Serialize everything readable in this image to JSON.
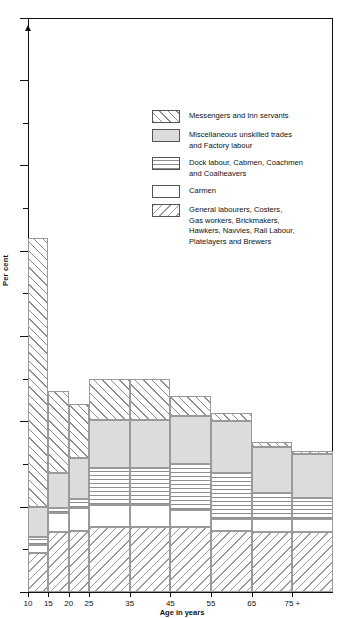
{
  "chart_data": {
    "type": "bar",
    "subtype": "stacked-bar-histogram",
    "title": "",
    "xlabel": "Age in years",
    "ylabel": "Per cent",
    "ylim": [
      0,
      60
    ],
    "y_axis_broken": true,
    "y_break_top_label": "100",
    "ytick_labels": [
      "0",
      "5",
      "10",
      "15",
      "20",
      "25",
      "30",
      "35",
      "40",
      "45",
      "50",
      "55",
      "60",
      "100"
    ],
    "ytick_values": [
      0,
      5,
      10,
      15,
      20,
      25,
      30,
      35,
      40,
      45,
      50,
      55,
      60,
      100
    ],
    "xtick_labels": [
      "10",
      "15",
      "20",
      "25",
      "35",
      "45",
      "55",
      "65",
      "75 +"
    ],
    "xtick_values": [
      10,
      15,
      20,
      25,
      35,
      45,
      55,
      65,
      75
    ],
    "grid": false,
    "legend_position": "upper-center",
    "categories": [
      "10-15",
      "15-20",
      "20-25",
      "25-35",
      "35-45",
      "45-55",
      "55-65",
      "65-75",
      "75 +"
    ],
    "bar_edges": [
      10,
      15,
      20,
      25,
      35,
      45,
      55,
      65,
      75,
      85
    ],
    "series": [
      {
        "name": "General labourers, Costers, Gas workers, Brickmakers, Hawkers, Navvies, Rail Labour, Platelayers and Brewers",
        "fill": "diagonal-hatch-down",
        "values": [
          4.6,
          7.0,
          7.2,
          7.6,
          7.6,
          7.6,
          7.2,
          7.0,
          7.0
        ]
      },
      {
        "name": "Carmen",
        "fill": "white",
        "values": [
          0.9,
          2.3,
          2.6,
          2.6,
          2.6,
          2.0,
          1.4,
          1.6,
          1.6
        ]
      },
      {
        "name": "Dock labour, Cabmen, Coachmen and Coalheavers",
        "fill": "horizontal-lines",
        "values": [
          0.9,
          0.6,
          1.1,
          4.3,
          4.3,
          5.4,
          5.4,
          3.0,
          2.4
        ]
      },
      {
        "name": "Miscellaneous unskilled trades and Factory labour",
        "fill": "solid-grey",
        "values": [
          3.6,
          4.1,
          4.8,
          5.7,
          5.7,
          5.6,
          6.0,
          5.4,
          5.2
        ]
      },
      {
        "name": "Messengers and Inn servants",
        "fill": "diagonal-hatch-up",
        "values": [
          31.5,
          9.5,
          6.3,
          4.8,
          4.8,
          2.4,
          1.0,
          0.6,
          0.3
        ]
      }
    ],
    "totals": [
      41.5,
      23.5,
      22.0,
      25.0,
      25.0,
      23.0,
      21.0,
      17.6,
      16.5
    ]
  },
  "legend": {
    "items": [
      {
        "label": "Messengers and Inn servants",
        "fill": "diagonal-hatch-up"
      },
      {
        "label": "Miscellaneous unskilled trades\nand Factory labour",
        "fill": "solid-grey"
      },
      {
        "label": "Dock labour, Cabmen, Coachmen\nand Coalheavers",
        "fill": "horizontal-lines"
      },
      {
        "label": "Carmen",
        "fill": "white"
      },
      {
        "label": "General labourers, Costers,\nGas workers, Brickmakers,\nHawkers, Navvies, Rail Labour,\nPlatelayers and Brewers",
        "fill": "diagonal-hatch-down"
      }
    ]
  },
  "colors": {
    "axis": "#111111",
    "hatch": "#8d8d8d",
    "solid_grey": "#dcdcdc",
    "segment_border": "#9a9a9a",
    "background": "#ffffff"
  }
}
